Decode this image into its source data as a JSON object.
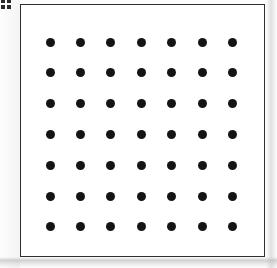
{
  "figure": {
    "type": "dot-lattice-figure",
    "label_fragment": "",
    "background_color": "#fdfdfd",
    "panel": {
      "fill_color": "#ffffff",
      "border_color": "#2f2f33",
      "border_width_px": 1.5,
      "x": 20,
      "y": 4,
      "width": 245,
      "height": 253
    },
    "dots": {
      "shape": "circle",
      "color": "#141414",
      "diameter_px": 9,
      "rows": 7,
      "columns": 7,
      "count": 49,
      "first_center_x": 29,
      "first_center_y": 37,
      "spacing_x_px": 30.4,
      "spacing_y_px": 30.8
    }
  },
  "chart_data": {
    "type": "scatter",
    "title": "",
    "subtitle": "",
    "xlabel": "",
    "ylabel": "",
    "grid": false,
    "legend": null,
    "annotations": [],
    "xlim": [
      0,
      8
    ],
    "ylim": [
      0,
      8
    ],
    "xticklabels": [],
    "yticklabels": [],
    "marker": "filled-circle",
    "marker_color": "#141414",
    "marker_size_px": 9,
    "series": [
      {
        "name": "lattice-points",
        "x": [
          1,
          2,
          3,
          4,
          5,
          6,
          7,
          1,
          2,
          3,
          4,
          5,
          6,
          7,
          1,
          2,
          3,
          4,
          5,
          6,
          7,
          1,
          2,
          3,
          4,
          5,
          6,
          7,
          1,
          2,
          3,
          4,
          5,
          6,
          7,
          1,
          2,
          3,
          4,
          5,
          6,
          7,
          1,
          2,
          3,
          4,
          5,
          6,
          7
        ],
        "y": [
          7,
          7,
          7,
          7,
          7,
          7,
          7,
          6,
          6,
          6,
          6,
          6,
          6,
          6,
          5,
          5,
          5,
          5,
          5,
          5,
          5,
          4,
          4,
          4,
          4,
          4,
          4,
          4,
          3,
          3,
          3,
          3,
          3,
          3,
          3,
          2,
          2,
          2,
          2,
          2,
          2,
          2,
          1,
          1,
          1,
          1,
          1,
          1,
          1
        ]
      }
    ]
  }
}
